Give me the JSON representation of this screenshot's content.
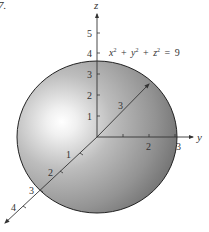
{
  "figure": {
    "label": "7.",
    "equation": {
      "x_term": "x",
      "y_term": "y",
      "z_term": "z",
      "exp": "2",
      "plus": "+",
      "equals": "=",
      "rhs": "9",
      "full_text": "x² + y² + z² = 9"
    },
    "colors": {
      "sphere_highlight": "#ffffff",
      "sphere_mid": "#b8b8b8",
      "sphere_dark": "#7a7a7a",
      "outline": "#222222",
      "axis": "#333333"
    },
    "axes": {
      "x": {
        "name": "x",
        "ticks": [
          "1",
          "2",
          "3",
          "4"
        ],
        "back_tick_label": "3"
      },
      "y": {
        "name": "y",
        "ticks": [
          "2",
          "3"
        ]
      },
      "z": {
        "name": "z",
        "ticks": [
          "1",
          "2",
          "3",
          "4",
          "5"
        ]
      }
    },
    "sphere": {
      "radius": 3,
      "center": [
        0,
        0,
        0
      ]
    }
  }
}
